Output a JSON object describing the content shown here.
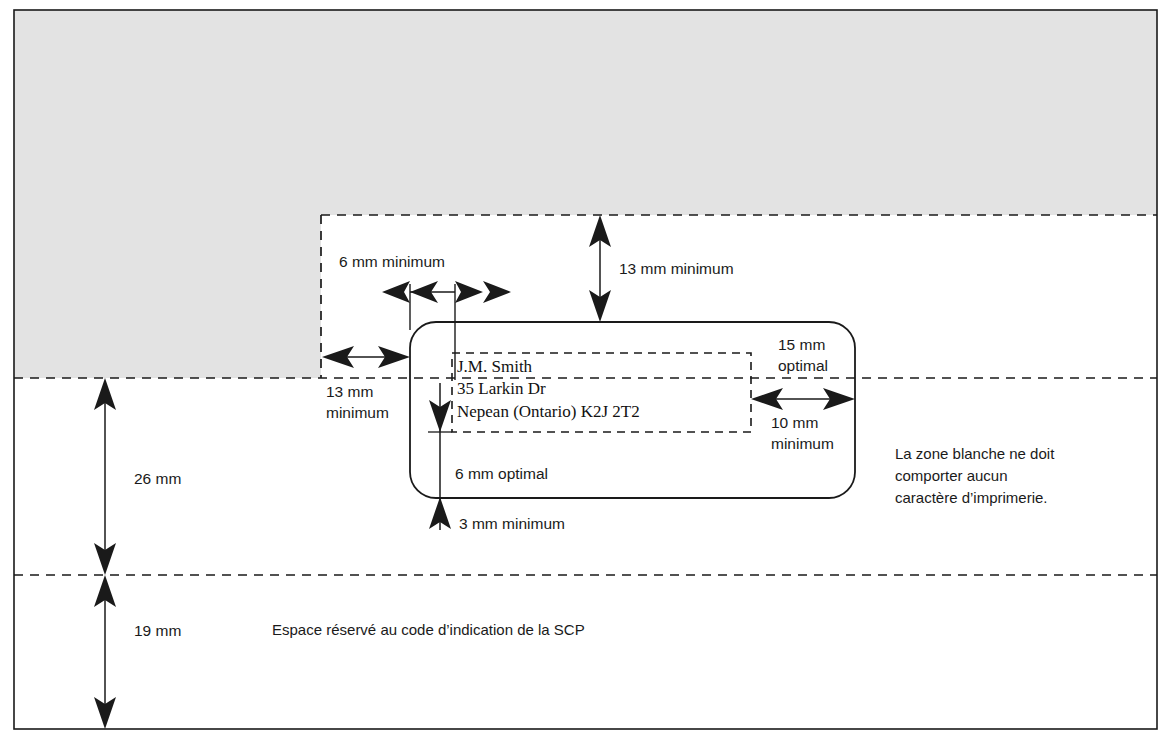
{
  "diagram": {
    "colors": {
      "gray_zone": "#e3e3e3",
      "line": "#1a1a1a",
      "text": "#1a1a1a",
      "background": "#ffffff"
    },
    "gray_zone_name": "restricted-printing-zone"
  },
  "labels": {
    "top_left_width": "6 mm minimum",
    "top_clearance": "13 mm minimum",
    "left_clearance_line1": "13 mm",
    "left_clearance_line2": "minimum",
    "right_clearance_line1": "15 mm",
    "right_clearance_line2": "optimal",
    "right_inner_line1": "10 mm",
    "right_inner_line2": "minimum",
    "inner_bottom_optimal": "6 mm optimal",
    "bottom_clearance": "3 mm minimum",
    "band_upper": "26 mm",
    "band_lower": "19 mm",
    "barcode_reserved": "Espace réservé au code d’indication de la SCP",
    "white_zone_note_line1": "La zone blanche ne doit",
    "white_zone_note_line2": "comporter aucun",
    "white_zone_note_line3": "caractère d’imprimerie."
  },
  "address_block": {
    "name": "sample-address",
    "lines": [
      "J.M. Smith",
      "35 Larkin Dr",
      "Nepean (Ontario)   K2J 2T2"
    ]
  }
}
